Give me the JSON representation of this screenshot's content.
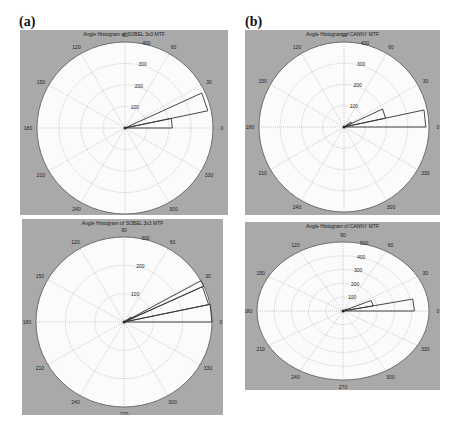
{
  "figure": {
    "labels": [
      "(a)",
      "(b)"
    ]
  },
  "chart_data": [
    {
      "id": "a",
      "type": "polar-histogram",
      "title": "Angle Histogram of SOBEL 3x3 MTF",
      "angle_ticks": [
        0,
        30,
        60,
        90,
        120,
        150,
        180,
        210,
        240,
        270,
        300,
        330
      ],
      "radial_ticks": [
        100,
        200,
        300,
        400
      ],
      "rmax": 400,
      "bins": [
        {
          "start_deg": 0,
          "end_deg": 12,
          "value": 215
        },
        {
          "start_deg": 12,
          "end_deg": 25,
          "value": 385
        }
      ],
      "panel": {
        "x": 20,
        "y": 30,
        "w": 208,
        "h": 185,
        "cx": 105,
        "cy": 98,
        "rx": 88,
        "ry": 86
      }
    },
    {
      "id": "b",
      "type": "polar-histogram",
      "title": "Angle Histogram of CANNY MTF",
      "angle_ticks": [
        0,
        30,
        60,
        90,
        120,
        150,
        180,
        210,
        240,
        270,
        300,
        330
      ],
      "radial_ticks": [
        100,
        200,
        300,
        400
      ],
      "rmax": 400,
      "bins": [
        {
          "start_deg": 0,
          "end_deg": 12,
          "value": 385
        },
        {
          "start_deg": 12,
          "end_deg": 25,
          "value": 200
        },
        {
          "start_deg": 25,
          "end_deg": 37,
          "value": 40
        }
      ],
      "panel": {
        "x": 245,
        "y": 30,
        "w": 195,
        "h": 185,
        "cx": 99,
        "cy": 97,
        "rx": 85,
        "ry": 85
      }
    },
    {
      "id": "c",
      "type": "polar-histogram",
      "title": "Angle Histogram of SOBEL 3x3 MTF",
      "angle_ticks": [
        0,
        30,
        60,
        90,
        120,
        150,
        180,
        210,
        240,
        270,
        300,
        330
      ],
      "radial_ticks": [
        100,
        200,
        300
      ],
      "rmax": 300,
      "bins": [
        {
          "start_deg": 0,
          "end_deg": 12,
          "value": 300
        },
        {
          "start_deg": 12,
          "end_deg": 25,
          "value": 295
        },
        {
          "start_deg": 25,
          "end_deg": 29,
          "value": 300
        },
        {
          "start_deg": 25,
          "end_deg": 37,
          "value": 30
        }
      ],
      "panel": {
        "x": 22,
        "y": 219,
        "w": 201,
        "h": 196,
        "cx": 102,
        "cy": 103,
        "rx": 88,
        "ry": 85
      }
    },
    {
      "id": "d",
      "type": "polar-histogram",
      "title": "Angle Histogram of CANNY MTF",
      "angle_ticks": [
        0,
        30,
        60,
        90,
        120,
        150,
        180,
        210,
        240,
        270,
        300,
        330
      ],
      "radial_ticks": [
        100,
        200,
        300,
        400,
        500
      ],
      "rmax": 500,
      "bins": [
        {
          "start_deg": 0,
          "end_deg": 12,
          "value": 415
        },
        {
          "start_deg": 12,
          "end_deg": 25,
          "value": 180
        },
        {
          "start_deg": 25,
          "end_deg": 37,
          "value": 25
        }
      ],
      "panel": {
        "x": 245,
        "y": 222,
        "w": 195,
        "h": 168,
        "cx": 98,
        "cy": 89,
        "rx": 86,
        "ry": 69
      }
    }
  ]
}
